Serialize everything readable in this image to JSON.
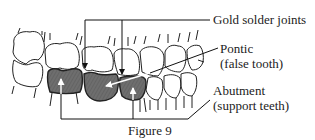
{
  "figure": {
    "caption": "Figure 9",
    "labels": {
      "gold_solder_joints": "Gold solder joints",
      "pontic": "Pontic",
      "pontic_sub": "(false tooth)",
      "abutment": "Abutment",
      "abutment_sub": "(support teeth)"
    },
    "colors": {
      "line": "#222222",
      "bridge_fill": "#6e6e6e",
      "background": "#ffffff"
    }
  }
}
